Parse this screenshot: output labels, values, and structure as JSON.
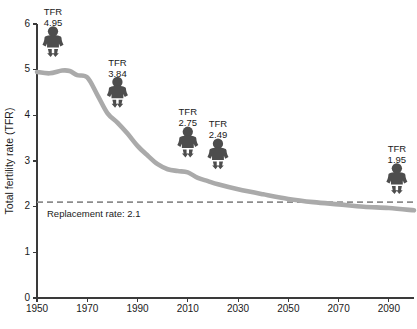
{
  "chart_data": {
    "type": "line",
    "title": "",
    "xlabel": "",
    "ylabel": "Total fertility rate (TFR)",
    "xlim": [
      1950,
      2100
    ],
    "ylim": [
      0,
      6
    ],
    "grid": false,
    "legend": "none",
    "x_ticks": [
      "1950",
      "1970",
      "1990",
      "2010",
      "2030",
      "2050",
      "2070",
      "2090"
    ],
    "x_tick_values": [
      1950,
      1970,
      1990,
      2010,
      2030,
      2050,
      2070,
      2090
    ],
    "y_ticks": [
      "0",
      "1",
      "2",
      "3",
      "4",
      "5",
      "6"
    ],
    "y_tick_values": [
      0,
      1,
      2,
      3,
      4,
      5,
      6
    ],
    "series": [
      {
        "name": "Total fertility rate (TFR)",
        "color": "#aaaaaa",
        "x": [
          1950,
          1955,
          1960,
          1963,
          1966,
          1970,
          1974,
          1978,
          1982,
          1986,
          1990,
          1994,
          1998,
          2002,
          2006,
          2010,
          2014,
          2018,
          2022,
          2030,
          2040,
          2050,
          2060,
          2070,
          2080,
          2090,
          2100
        ],
        "y": [
          4.95,
          4.92,
          4.98,
          4.97,
          4.88,
          4.83,
          4.45,
          4.05,
          3.84,
          3.6,
          3.33,
          3.12,
          2.93,
          2.82,
          2.78,
          2.75,
          2.63,
          2.56,
          2.49,
          2.38,
          2.27,
          2.17,
          2.1,
          2.05,
          2.0,
          1.97,
          1.92
        ]
      }
    ],
    "reference_line": {
      "label": "Replacement rate: 2.1",
      "value": 2.1,
      "style": "dashed",
      "color": "#8c8c8c"
    },
    "annotations": [
      {
        "prefix": "TFR",
        "value": "4.95",
        "year": 1950,
        "icon": "baby-icon"
      },
      {
        "prefix": "TFR",
        "value": "3.84",
        "year": 1982,
        "icon": "baby-icon"
      },
      {
        "prefix": "TFR",
        "value": "2.75",
        "year": 2010,
        "icon": "baby-icon"
      },
      {
        "prefix": "TFR",
        "value": "2.49",
        "year": 2022,
        "icon": "baby-icon"
      },
      {
        "prefix": "TFR",
        "value": "1.95",
        "year": 2090,
        "icon": "baby-icon"
      }
    ]
  }
}
